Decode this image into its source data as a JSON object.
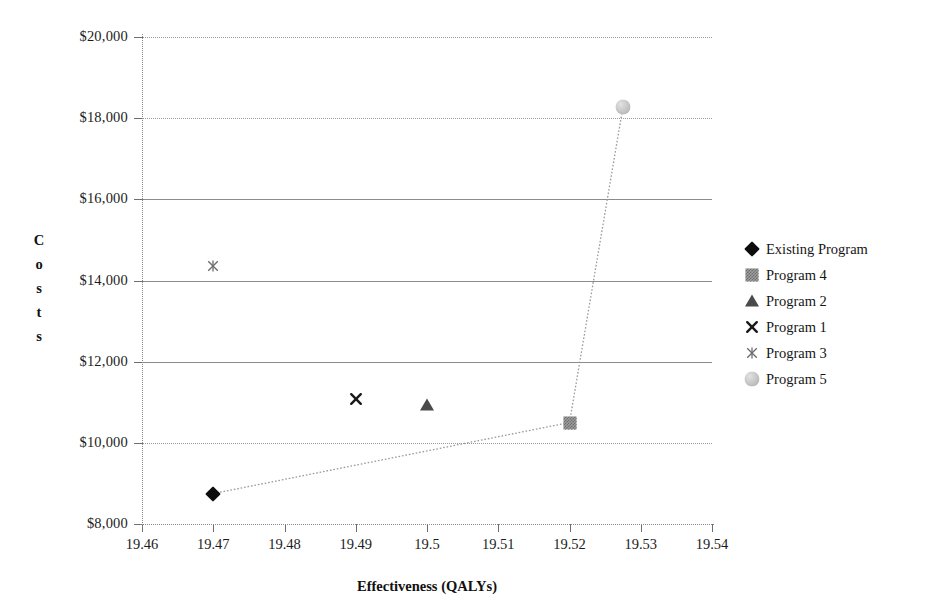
{
  "chart_data": {
    "type": "scatter",
    "title": "",
    "xlabel": "Effectiveness (QALYs)",
    "ylabel": "Costs",
    "xlim": [
      19.46,
      19.54
    ],
    "ylim": [
      8000,
      20000
    ],
    "grid": true,
    "legend_position": "right",
    "x_ticks": [
      "19.46",
      "19.47",
      "19.48",
      "19.49",
      "19.5",
      "19.51",
      "19.52",
      "19.53",
      "19.54"
    ],
    "x_tick_values": [
      19.46,
      19.47,
      19.48,
      19.49,
      19.5,
      19.51,
      19.52,
      19.53,
      19.54
    ],
    "y_ticks": [
      "$8,000",
      "$10,000",
      "$12,000",
      "$14,000",
      "$16,000",
      "$18,000",
      "$20,000"
    ],
    "y_tick_values": [
      8000,
      10000,
      12000,
      14000,
      16000,
      18000,
      20000
    ],
    "series": [
      {
        "name": "Existing Program",
        "marker": "diamond",
        "color": "#0d0d0d",
        "points": [
          {
            "x": 19.47,
            "y": 8750
          }
        ]
      },
      {
        "name": "Program 4",
        "marker": "square",
        "color": "#9d9d9d",
        "points": [
          {
            "x": 19.52,
            "y": 10500
          }
        ]
      },
      {
        "name": "Program 2",
        "marker": "triangle",
        "color": "#4a4a4a",
        "points": [
          {
            "x": 19.5,
            "y": 10930
          }
        ]
      },
      {
        "name": "Program 1",
        "marker": "cross",
        "color": "#1a1a1a",
        "points": [
          {
            "x": 19.49,
            "y": 11080
          }
        ]
      },
      {
        "name": "Program 3",
        "marker": "x-thin",
        "color": "#6b6b6b",
        "points": [
          {
            "x": 19.47,
            "y": 14350
          }
        ]
      },
      {
        "name": "Program 5",
        "marker": "circle",
        "color": "#c4c4c4",
        "points": [
          {
            "x": 19.5275,
            "y": 18270
          }
        ]
      }
    ],
    "frontier": {
      "name": "efficiency-frontier",
      "style": "dotted",
      "color": "#9a9a9a",
      "points": [
        {
          "x": 19.47,
          "y": 8750
        },
        {
          "x": 19.52,
          "y": 10500
        },
        {
          "x": 19.5275,
          "y": 18270
        }
      ]
    }
  },
  "axes": {
    "y_title_letters": [
      "C",
      "o",
      "s",
      "t",
      "s"
    ],
    "x_title": "Effectiveness (QALYs)"
  },
  "legend": {
    "entries": [
      {
        "label": "Existing Program",
        "marker": "diamond"
      },
      {
        "label": "Program 4",
        "marker": "square"
      },
      {
        "label": "Program 2",
        "marker": "triangle"
      },
      {
        "label": "Program 1",
        "marker": "cross"
      },
      {
        "label": "Program 3",
        "marker": "x-thin"
      },
      {
        "label": "Program 5",
        "marker": "circle"
      }
    ]
  }
}
